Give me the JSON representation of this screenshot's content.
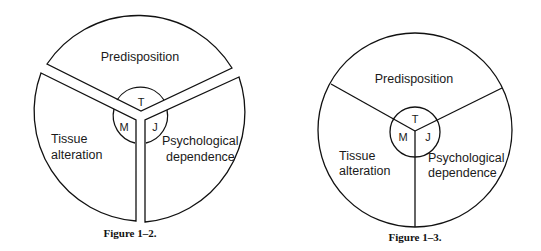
{
  "figures": [
    {
      "caption": "Figure 1–2.",
      "segments": {
        "top": "Predisposition",
        "left_line1": "Tissue",
        "left_line2": "alteration",
        "right_line1": "Psychological",
        "right_line2": "dependence"
      },
      "center_labels": {
        "top": "T",
        "left": "M",
        "right": "J"
      },
      "style": "separated segments"
    },
    {
      "caption": "Figure 1–3.",
      "segments": {
        "top": "Predisposition",
        "left_line1": "Tissue",
        "left_line2": "alteration",
        "right_line1": "Psychological",
        "right_line2": "dependence"
      },
      "center_labels": {
        "top": "T",
        "left": "M",
        "right": "J"
      },
      "style": "joined segments"
    }
  ]
}
